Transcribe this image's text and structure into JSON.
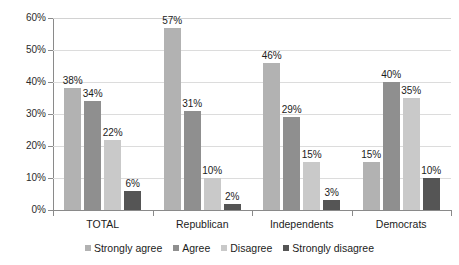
{
  "chart_data": {
    "type": "bar",
    "title": "",
    "subtitle": "",
    "xlabel": "",
    "ylabel": "",
    "categories": [
      "TOTAL",
      "Republican",
      "Independents",
      "Democrats"
    ],
    "series": [
      {
        "name": "Strongly agree",
        "color": "#b2b2b2",
        "values": [
          38,
          57,
          46,
          15
        ],
        "labels": [
          "38%",
          "57%",
          "46%",
          "15%"
        ]
      },
      {
        "name": "Agree",
        "color": "#8f8f8f",
        "values": [
          34,
          31,
          29,
          40
        ],
        "labels": [
          "34%",
          "31%",
          "29%",
          "40%"
        ]
      },
      {
        "name": "Disagree",
        "color": "#c9c9c9",
        "values": [
          22,
          10,
          15,
          35
        ],
        "labels": [
          "22%",
          "10%",
          "15%",
          "35%"
        ]
      },
      {
        "name": "Strongly disagree",
        "color": "#555555",
        "values": [
          6,
          2,
          3,
          10
        ],
        "labels": [
          "6%",
          "2%",
          "3%",
          "10%"
        ]
      }
    ],
    "ylim": [
      0,
      60
    ],
    "ytick_values": [
      0,
      10,
      20,
      30,
      40,
      50,
      60
    ],
    "ytick_labels": [
      "0%",
      "10%",
      "20%",
      "30%",
      "40%",
      "50%",
      "60%"
    ],
    "grid": true,
    "grid_axis": "y",
    "legend_position": "bottom",
    "value_labels": true
  },
  "axis": {
    "y": {
      "ticks": [
        {
          "label": "60%",
          "value": 60
        },
        {
          "label": "50%",
          "value": 50
        },
        {
          "label": "40%",
          "value": 40
        },
        {
          "label": "30%",
          "value": 30
        },
        {
          "label": "20%",
          "value": 20
        },
        {
          "label": "10%",
          "value": 10
        },
        {
          "label": "0%",
          "value": 0
        }
      ]
    },
    "x": {
      "categories": [
        {
          "label": "TOTAL"
        },
        {
          "label": "Republican"
        },
        {
          "label": "Independents"
        },
        {
          "label": "Democrats"
        }
      ]
    }
  },
  "legend": {
    "items": [
      {
        "label": "Strongly agree",
        "color": "#b2b2b2"
      },
      {
        "label": "Agree",
        "color": "#8f8f8f"
      },
      {
        "label": "Disagree",
        "color": "#c9c9c9"
      },
      {
        "label": "Strongly disagree",
        "color": "#555555"
      }
    ]
  },
  "colors": {
    "background": "#ffffff",
    "axis": "#8a8a8a",
    "gridline": "#dcdcdc",
    "text": "#1c1c1c",
    "series_strongly_agree": "#b2b2b2",
    "series_agree": "#8f8f8f",
    "series_disagree": "#c9c9c9",
    "series_strongly_disagree": "#555555"
  }
}
